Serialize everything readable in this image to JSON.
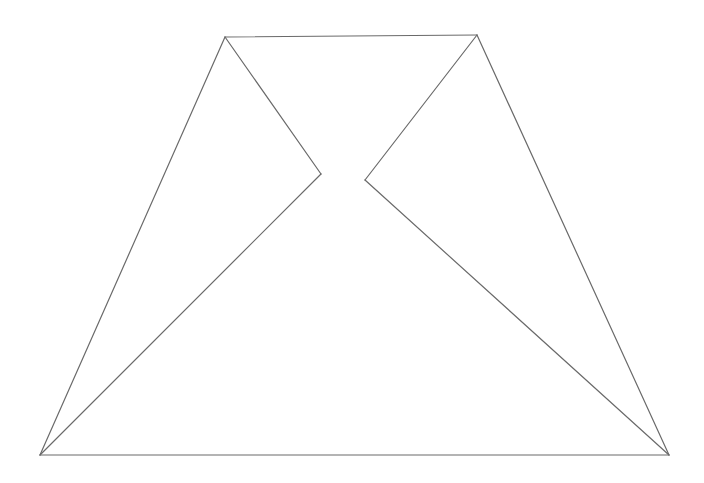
{
  "diagram": {
    "title": "",
    "background": "#ffffff",
    "stroke_color": "#6a6a6a",
    "stroke_width": 1.2,
    "vertices": {
      "top_left": [
        225,
        37
      ],
      "top_right": [
        477,
        35
      ],
      "bottom_left": [
        40,
        455
      ],
      "bottom_right": [
        669,
        455
      ],
      "notch_left": [
        321,
        174
      ],
      "notch_right": [
        365,
        180
      ]
    },
    "edges": [
      {
        "name": "top-edge",
        "from": "top_left",
        "to": "top_right"
      },
      {
        "name": "bottom-edge",
        "from": "bottom_left",
        "to": "bottom_right"
      },
      {
        "name": "left-outer-edge",
        "from": "top_left",
        "to": "bottom_left"
      },
      {
        "name": "right-outer-edge",
        "from": "top_right",
        "to": "bottom_right"
      },
      {
        "name": "left-notch-upper-edge",
        "from": "top_left",
        "to": "notch_left"
      },
      {
        "name": "left-notch-lower-edge",
        "from": "notch_left",
        "to": "bottom_left"
      },
      {
        "name": "right-notch-upper-edge",
        "from": "top_right",
        "to": "notch_right"
      },
      {
        "name": "right-notch-lower-edge",
        "from": "notch_right",
        "to": "bottom_right"
      }
    ]
  }
}
